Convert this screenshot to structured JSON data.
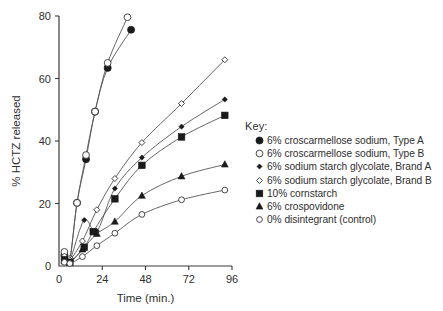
{
  "chart_data": {
    "type": "line",
    "title": "",
    "xlabel": "Time (min.)",
    "ylabel": "% HCTZ released",
    "xlim": [
      0,
      96
    ],
    "ylim": [
      0,
      80
    ],
    "xticks": [
      0,
      24,
      48,
      72,
      96
    ],
    "yticks": [
      0,
      20,
      40,
      60,
      80
    ],
    "xtick_labels": [
      "0",
      "24",
      "48",
      "72",
      "96"
    ],
    "ytick_labels": [
      "0",
      "20",
      "40",
      "60",
      "80"
    ],
    "grid": false,
    "legend_position": "right",
    "legend_title": "Key:",
    "series": [
      {
        "name": "6% croscarmellose sodium, Type A",
        "marker": "filled-circle",
        "x": [
          3,
          6,
          10,
          15,
          20,
          27,
          40
        ],
        "y": [
          3.5,
          2.0,
          20.2,
          34.2,
          49.4,
          63.4,
          75.6
        ]
      },
      {
        "name": "6% croscarmellose sodium, Type B",
        "marker": "open-circle",
        "x": [
          3,
          6,
          10,
          15,
          20,
          27,
          38
        ],
        "y": [
          4.5,
          2.2,
          20.2,
          35.5,
          49.4,
          65.0,
          79.6
        ]
      },
      {
        "name": "6% sodium starch glycolate, Brand A",
        "marker": "filled-diamond",
        "x": [
          3,
          6,
          14,
          21,
          31,
          46,
          68,
          92
        ],
        "y": [
          3.0,
          1.8,
          14.7,
          11.2,
          24.8,
          34.7,
          44.6,
          53.3
        ]
      },
      {
        "name": "6% sodium starch glycolate, Brand B",
        "marker": "open-diamond",
        "x": [
          3,
          6,
          13,
          21,
          31,
          46,
          68,
          92
        ],
        "y": [
          3.2,
          2.0,
          8.0,
          18.0,
          28.0,
          39.5,
          52.0,
          66.0
        ]
      },
      {
        "name": "10% cornstarch",
        "marker": "filled-square",
        "x": [
          3,
          6,
          14,
          19,
          31,
          46,
          68,
          92
        ],
        "y": [
          2.0,
          1.2,
          6.0,
          11.0,
          21.5,
          32.2,
          41.3,
          48.2
        ]
      },
      {
        "name": "6% crospovidone",
        "marker": "filled-triangle",
        "x": [
          3,
          6,
          13,
          21,
          31,
          46,
          68,
          92
        ],
        "y": [
          1.5,
          1.0,
          5.3,
          10.3,
          14.2,
          22.5,
          28.7,
          32.5
        ]
      },
      {
        "name": "0% disintegrant (control)",
        "marker": "open-circle-small",
        "x": [
          3,
          6,
          13,
          21,
          31,
          46,
          68,
          92
        ],
        "y": [
          1.2,
          0.8,
          3.0,
          6.5,
          10.5,
          16.5,
          21.2,
          24.3
        ]
      }
    ]
  },
  "legend": {
    "title": "Key:",
    "items": [
      {
        "marker": "filled-circle",
        "label": "6% croscarmellose sodium, Type A"
      },
      {
        "marker": "open-circle",
        "label": "6% croscarmellose sodium, Type B"
      },
      {
        "marker": "filled-diamond",
        "label": "6% sodium starch glycolate, Brand A"
      },
      {
        "marker": "open-diamond",
        "label": "6% sodium starch glycolate, Brand B"
      },
      {
        "marker": "filled-square",
        "label": "10% cornstarch"
      },
      {
        "marker": "filled-triangle",
        "label": "6% crospovidone"
      },
      {
        "marker": "open-circle-small",
        "label": "0% disintegrant (control)"
      }
    ]
  },
  "colors": {
    "ink": "#1a1a1a",
    "axis": "#3a3a3a",
    "curve": "#555555",
    "background": "#ffffff"
  }
}
